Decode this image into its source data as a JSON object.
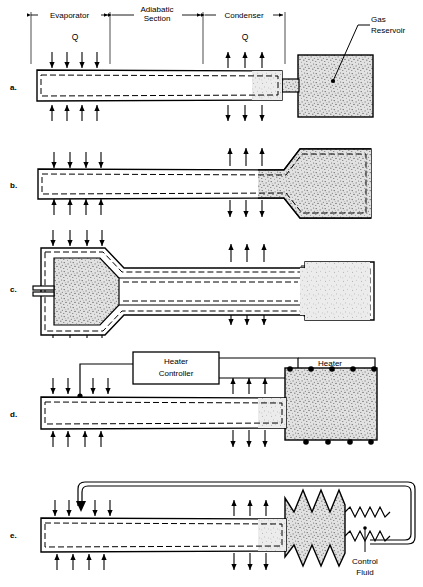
{
  "figure": {
    "panels": [
      {
        "letter": "a.",
        "name": "gas-loaded-hot-reservoir"
      },
      {
        "letter": "b.",
        "name": "gas-loaded-cold-wicked-reservoir"
      },
      {
        "letter": "c.",
        "name": "gas-loaded-feedback-reservoir"
      },
      {
        "letter": "d.",
        "name": "active-feedback-heated-reservoir"
      },
      {
        "letter": "e.",
        "name": "active-feedback-bellows-reservoir"
      }
    ],
    "section_labels": {
      "evaporator": "Evaporator",
      "adiabatic_line1": "Adiabatic",
      "adiabatic_line2": "Section",
      "condenser": "Condenser"
    },
    "heat_label": "Q",
    "callouts": {
      "gas_reservoir_line1": "Gas",
      "gas_reservoir_line2": "Reservoir",
      "heater_controller_line1": "Heater",
      "heater_controller_line2": "Controller",
      "heater": "Heater",
      "control_fluid_line1": "Control",
      "control_fluid_line2": "Fluid",
      "temperature_sensor": "T"
    },
    "colors": {
      "ink": "#000000",
      "paper": "#ffffff",
      "stipple_fill": "#d9d9d9",
      "stipple_dots": "#4a4a4a"
    },
    "arrow_counts": {
      "evaporator_top": 4,
      "evaporator_bottom": 4,
      "condenser_top": 3,
      "condenser_bottom": 3
    },
    "heater_dots": {
      "top": 5,
      "bottom": 4
    }
  }
}
